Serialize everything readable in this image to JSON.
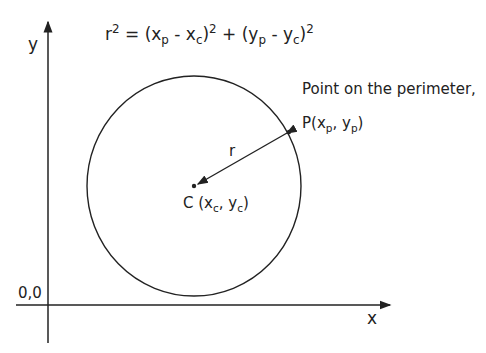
{
  "diagram": {
    "equation": {
      "r": "r",
      "sq": "2",
      "eq": " = (x",
      "p1": "p",
      "minus1": " - x",
      "c1": "c",
      "close1": ")",
      "sq1": "2",
      "plus": " + (y",
      "p2": "p",
      "minus2": " - y",
      "c2": "c",
      "close2": ")",
      "sq2": "2"
    },
    "axis_y_label": "y",
    "axis_x_label": "x",
    "origin_label": "0,0",
    "perimeter_label": "Point on the perimeter,",
    "point_p": {
      "prefix": "P(x",
      "sub1": "p",
      "mid": ", y",
      "sub2": "p",
      "suffix": ")"
    },
    "center": {
      "prefix": "C (x",
      "sub1": "c",
      "mid": ", y",
      "sub2": "c",
      "suffix": ")"
    },
    "radius_label": "r",
    "colors": {
      "line": "#222222",
      "background": "#ffffff"
    }
  }
}
